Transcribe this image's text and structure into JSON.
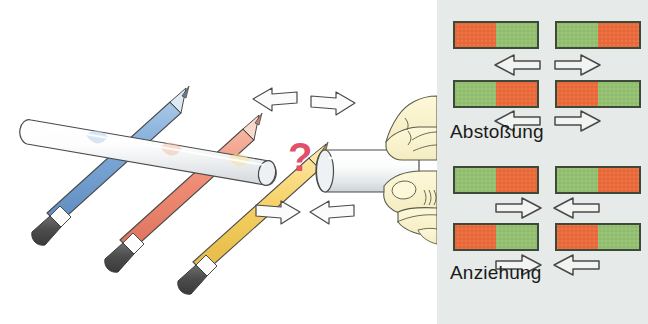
{
  "figure": {
    "background_color": "#ffffff"
  },
  "left_panel": {
    "name": "pencil-magnet-illustration",
    "background_color": "#ffffff",
    "description_icons": {
      "question_mark": "?",
      "question_mark_color": "#e0506a"
    },
    "objects": [
      {
        "name": "pencil-blue",
        "color": "#7fa9d8",
        "tip_color": "#b8cfe8",
        "eraser_color": "#4d4d4d"
      },
      {
        "name": "pencil-red",
        "color": "#ef8b74",
        "tip_color": "#f3b6a3",
        "eraser_color": "#4d4d4d"
      },
      {
        "name": "pencil-yellow",
        "color": "#f5cf62",
        "tip_color": "#f7e08f",
        "eraser_color": "#4d4d4d"
      },
      {
        "name": "white-rod-left",
        "color": "#fbfbfb"
      },
      {
        "name": "white-rod-right",
        "color": "#fbfbfb"
      },
      {
        "name": "hand",
        "color": "#f7f0cd"
      }
    ],
    "arrows": [
      {
        "name": "arrow-top-left",
        "direction": "left"
      },
      {
        "name": "arrow-top-right",
        "direction": "right"
      },
      {
        "name": "arrow-bottom-left",
        "direction": "right"
      },
      {
        "name": "arrow-bottom-right",
        "direction": "left"
      }
    ]
  },
  "right_panel": {
    "name": "magnet-pole-diagram",
    "background_color": "#e6eae8",
    "colors": {
      "north_pole": "#ea6a3a",
      "south_pole": "#93c070",
      "bar_border": "#3d4a3a",
      "arrow_stroke": "#4a4a4a",
      "arrow_fill": "#f2f4f2"
    },
    "captions": {
      "repulsion": "Abstoßung",
      "attraction": "Anziehung"
    },
    "groups": [
      {
        "name": "repulsion-group",
        "caption": "Abstoßung",
        "rows": [
          {
            "name": "repulsion-row-1",
            "left_magnet": {
              "left_half": "#ea6a3a",
              "right_half": "#93c070"
            },
            "right_magnet": {
              "left_half": "#93c070",
              "right_half": "#ea6a3a"
            },
            "arrows": [
              "left",
              "right"
            ]
          },
          {
            "name": "repulsion-row-2",
            "left_magnet": {
              "left_half": "#93c070",
              "right_half": "#ea6a3a"
            },
            "right_magnet": {
              "left_half": "#ea6a3a",
              "right_half": "#93c070"
            },
            "arrows": [
              "left",
              "right"
            ]
          }
        ]
      },
      {
        "name": "attraction-group",
        "caption": "Anziehung",
        "rows": [
          {
            "name": "attraction-row-1",
            "left_magnet": {
              "left_half": "#93c070",
              "right_half": "#ea6a3a"
            },
            "right_magnet": {
              "left_half": "#93c070",
              "right_half": "#ea6a3a"
            },
            "arrows": [
              "right",
              "left"
            ]
          },
          {
            "name": "attraction-row-2",
            "left_magnet": {
              "left_half": "#ea6a3a",
              "right_half": "#93c070"
            },
            "right_magnet": {
              "left_half": "#ea6a3a",
              "right_half": "#93c070"
            },
            "arrows": [
              "right",
              "left"
            ]
          }
        ]
      }
    ]
  }
}
